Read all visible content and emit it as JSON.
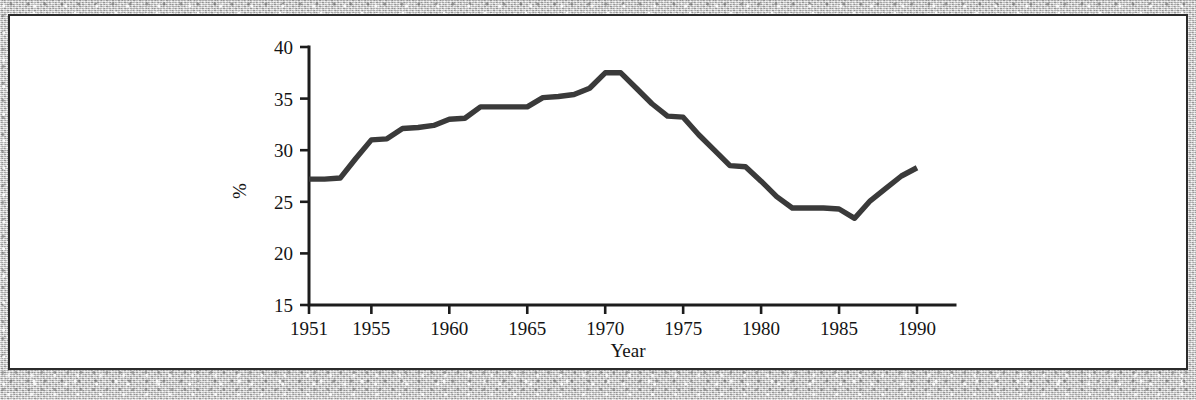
{
  "page": {
    "cropped_header_text": "· ·  ·       ·",
    "background_style": "scanned-paper-speckle"
  },
  "figure": {
    "border_color": "#2b2b2b",
    "panel_color": "#ffffff"
  },
  "chart_data": {
    "type": "line",
    "title": "",
    "xlabel": "Year",
    "ylabel": "%",
    "xlim": [
      1951,
      1990
    ],
    "ylim": [
      15,
      40
    ],
    "grid": false,
    "legend": false,
    "line_color": "#3a3a3a",
    "x_ticks": [
      "1951",
      "1955",
      "1960",
      "1965",
      "1970",
      "1975",
      "1980",
      "1985",
      "1990"
    ],
    "x_tick_values": [
      1951,
      1955,
      1960,
      1965,
      1970,
      1975,
      1980,
      1985,
      1990
    ],
    "y_ticks": [
      "15",
      "20",
      "25",
      "30",
      "35",
      "40"
    ],
    "y_tick_values": [
      15,
      20,
      25,
      30,
      35,
      40
    ],
    "x": [
      1951,
      1952,
      1953,
      1954,
      1955,
      1956,
      1957,
      1958,
      1959,
      1960,
      1961,
      1962,
      1963,
      1964,
      1965,
      1966,
      1967,
      1968,
      1969,
      1970,
      1971,
      1972,
      1973,
      1974,
      1975,
      1976,
      1977,
      1978,
      1979,
      1980,
      1981,
      1982,
      1983,
      1984,
      1985,
      1986,
      1987,
      1988,
      1989,
      1990
    ],
    "values": [
      27.2,
      27.2,
      27.3,
      29.2,
      31.0,
      31.1,
      32.1,
      32.2,
      32.4,
      33.0,
      33.1,
      34.2,
      34.2,
      34.2,
      34.2,
      35.1,
      35.2,
      35.4,
      36.0,
      37.5,
      37.5,
      36.0,
      34.5,
      33.3,
      33.2,
      31.5,
      30.0,
      28.5,
      28.4,
      27.0,
      25.5,
      24.4,
      24.4,
      24.4,
      24.3,
      23.4,
      25.1,
      26.3,
      27.5,
      28.3
    ],
    "series_name": "%"
  }
}
